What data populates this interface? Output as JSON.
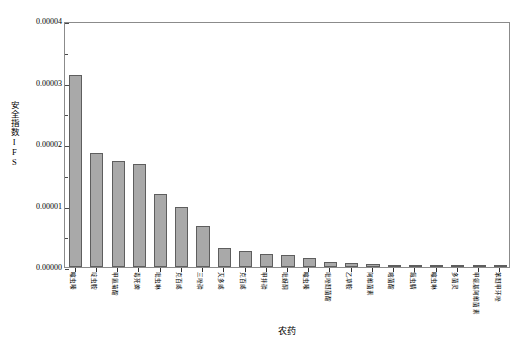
{
  "chart_data": {
    "type": "bar",
    "title": "",
    "xlabel": "农药",
    "ylabel": "安全指数IFS",
    "ylim": [
      0,
      4e-05
    ],
    "ytick_labels": [
      "0.00000",
      "0.00001",
      "0.00002",
      "0.00003",
      "0.00004"
    ],
    "ytick_values": [
      0,
      1e-05,
      2e-05,
      3e-05,
      4e-05
    ],
    "yminor_count_per_interval": 1,
    "grid": false,
    "legend": null,
    "bar_fill_color": "#a9a9a9",
    "bar_edge_color": "#5e5e5e",
    "frame_color": "#8b8b8b",
    "categories": [
      "噻虫嗪",
      "啶虫胺",
      "甲氰菊酯",
      "毒死蜱",
      "吡虫啉",
      "克百威",
      "三唑磷",
      "灭多威",
      "克百威",
      "甲拌磷",
      "吡蚜酮",
      "噻虫嗪",
      "吡唑醚菌酯",
      "乙草胺",
      "阿维菌素",
      "嘧菌酯",
      "氟虫腈",
      "噻虫啉",
      "多菌灵",
      "甲氨基阿维菌素",
      "苯醚甲环唑"
    ],
    "values": [
      3.13e-05,
      1.85e-05,
      1.72e-05,
      1.67e-05,
      1.18e-05,
      9.8e-06,
      6.7e-06,
      3.1e-06,
      2.6e-06,
      2.1e-06,
      1.9e-06,
      1.4e-06,
      8e-07,
      6e-07,
      5e-07,
      4e-07,
      3e-07,
      1.8e-07,
      1.2e-07,
      8e-08,
      5e-08
    ]
  }
}
